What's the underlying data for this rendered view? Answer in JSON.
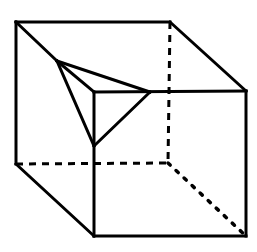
{
  "diagram": {
    "type": "cube-with-corner-cut",
    "stroke_color": "#000000",
    "background": "#ffffff",
    "vertices": {
      "back_top_left": [
        16,
        22
      ],
      "back_top_right": [
        170,
        22
      ],
      "back_bottom_left": [
        16,
        164
      ],
      "back_bottom_right": [
        168,
        163
      ],
      "front_top_left": [
        94,
        92
      ],
      "front_top_right": [
        246,
        91
      ],
      "front_bottom_left": [
        94,
        236
      ],
      "front_bottom_right": [
        246,
        236
      ],
      "cut_top": [
        57,
        61
      ],
      "cut_right": [
        150,
        92
      ],
      "cut_bottom": [
        94,
        146
      ]
    },
    "visible_edges": [
      [
        "back_top_left",
        "back_top_right"
      ],
      [
        "back_top_right",
        "front_top_right"
      ],
      [
        "back_top_left",
        "back_bottom_left"
      ],
      [
        "back_bottom_left",
        "front_bottom_left"
      ],
      [
        "front_bottom_left",
        "front_bottom_right"
      ],
      [
        "front_top_right",
        "front_bottom_right"
      ],
      [
        "front_top_left",
        "front_bottom_left"
      ],
      [
        "front_top_left",
        "front_top_right"
      ],
      [
        "back_top_left",
        "cut_top"
      ],
      [
        "cut_top",
        "cut_right"
      ],
      [
        "cut_right",
        "cut_bottom"
      ],
      [
        "cut_bottom",
        "cut_top"
      ],
      [
        "cut_top",
        "front_top_left"
      ]
    ],
    "hidden_edges_dashed": [
      [
        "back_top_right",
        "back_bottom_right"
      ],
      [
        "back_bottom_left",
        "back_bottom_right"
      ]
    ],
    "hidden_edges_dotted": [
      [
        "back_bottom_right",
        "front_bottom_right"
      ]
    ]
  }
}
